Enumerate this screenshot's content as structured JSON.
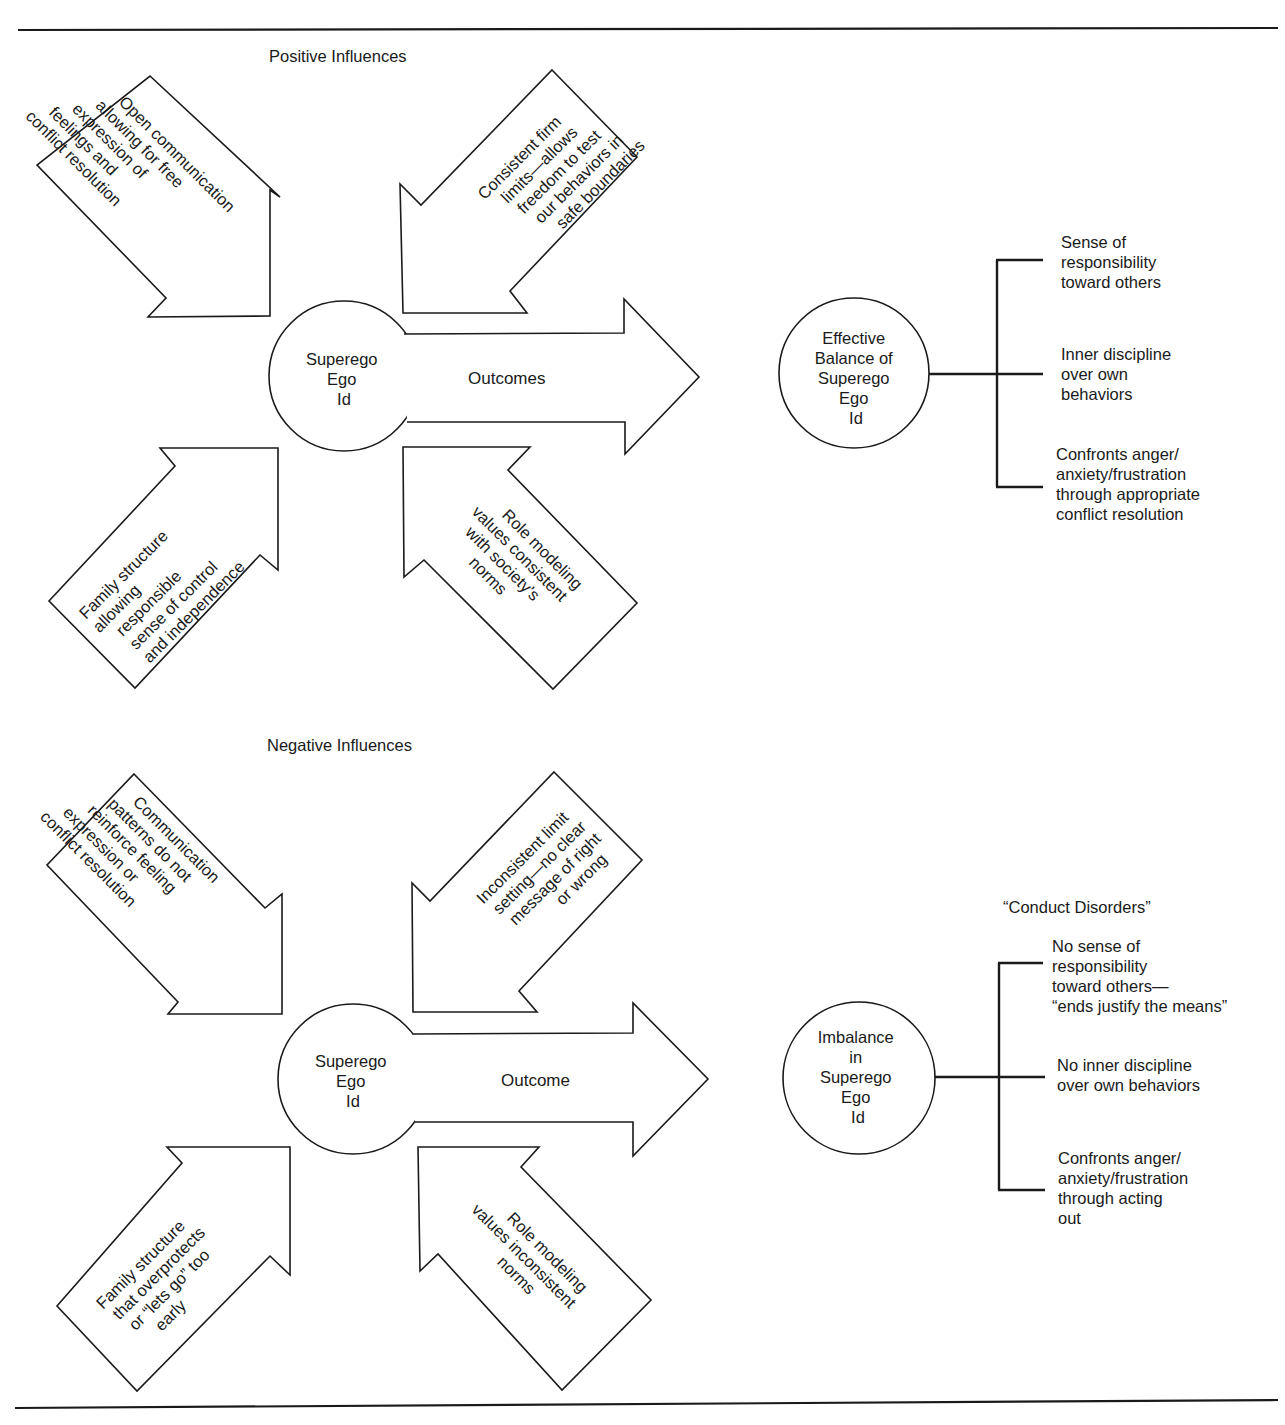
{
  "figure": {
    "positive": {
      "heading": "Positive Influences",
      "center_circle": {
        "lines": [
          "Superego",
          "Ego",
          "Id"
        ]
      },
      "outcome_arrow_label": "Outcomes",
      "influences": [
        {
          "position": "upper-left",
          "direction": "down-right",
          "lines": [
            "Open communication",
            "allowing for free",
            "expression of",
            "feelings and",
            "conflict resolution"
          ]
        },
        {
          "position": "upper-right",
          "direction": "down-left",
          "lines": [
            "Consistent firm",
            "limits—allows",
            "freedom to test",
            "our behaviors in",
            "safe boundaries"
          ]
        },
        {
          "position": "lower-left",
          "direction": "up-right",
          "lines": [
            "Family structure",
            "allowing",
            "responsible",
            "sense of control",
            "and independence"
          ]
        },
        {
          "position": "lower-right",
          "direction": "up-left",
          "lines": [
            "Role modeling",
            "values consistent",
            "with society’s",
            "norms"
          ]
        }
      ],
      "result_circle": {
        "lines": [
          "Effective",
          "Balance of",
          "Superego",
          "Ego",
          "Id"
        ]
      },
      "results": [
        {
          "lines": [
            "Sense of",
            "responsibility",
            "toward others"
          ]
        },
        {
          "lines": [
            "Inner discipline",
            "over own",
            "behaviors"
          ]
        },
        {
          "lines": [
            "Confronts anger/",
            "anxiety/frustration",
            "through appropriate",
            "conflict resolution"
          ]
        }
      ]
    },
    "negative": {
      "heading": "Negative Influences",
      "center_circle": {
        "lines": [
          "Superego",
          "Ego",
          "Id"
        ]
      },
      "outcome_arrow_label": "Outcome",
      "influences": [
        {
          "position": "upper-left",
          "direction": "down-right",
          "lines": [
            "Communication",
            "patterns do not",
            "reinforce feeling",
            "expression or",
            "conflict resolution"
          ]
        },
        {
          "position": "upper-right",
          "direction": "down-left",
          "lines": [
            "Inconsistent limit",
            "setting—no clear",
            "message of right",
            "or wrong"
          ]
        },
        {
          "position": "lower-left",
          "direction": "up-right",
          "lines": [
            "Family structure",
            "that overprotects",
            "or “lets go” too",
            "early"
          ]
        },
        {
          "position": "lower-right",
          "direction": "up-left",
          "lines": [
            "Role modeling",
            "values inconsistent",
            "norms"
          ]
        }
      ],
      "result_heading": "“Conduct Disorders”",
      "result_circle": {
        "lines": [
          "Imbalance",
          "in",
          "Superego",
          "Ego",
          "Id"
        ]
      },
      "results": [
        {
          "lines": [
            "No sense of",
            "responsibility",
            "toward others—",
            "“ends justify the means”"
          ]
        },
        {
          "lines": [
            "No inner discipline",
            "over own behaviors"
          ]
        },
        {
          "lines": [
            "Confronts anger/",
            "anxiety/frustration",
            "through acting",
            "out"
          ]
        }
      ]
    }
  }
}
